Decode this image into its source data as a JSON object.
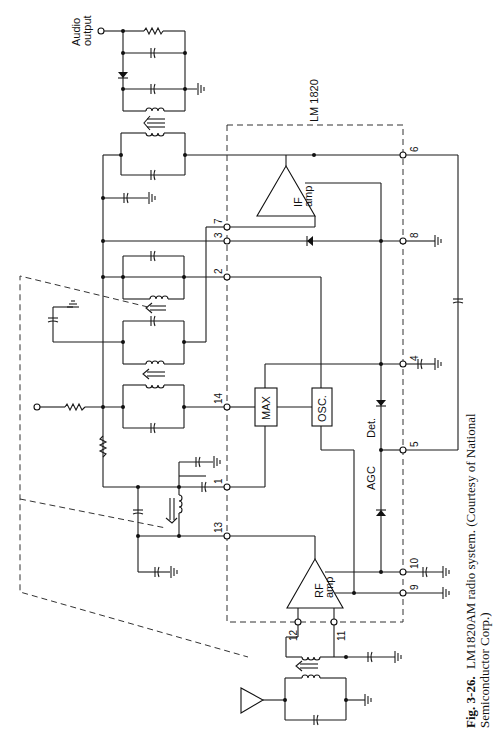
{
  "figure": {
    "chip_label": "LM 1820",
    "audio_output_label": [
      "Audio",
      "output"
    ],
    "blocks": {
      "if_amp": [
        "IF",
        "amp"
      ],
      "rf_amp": [
        "RF",
        "amp"
      ],
      "mixer": "MAX",
      "oscillator": "OSC.",
      "detector": "Det.",
      "agc": "AGC"
    },
    "pins": {
      "p1": "1",
      "p2": "2",
      "p3": "3",
      "p4": "4",
      "p5": "5",
      "p6": "6",
      "p7": "7",
      "p8": "8",
      "p9": "9",
      "p10": "10",
      "p11": "11",
      "p12": "12",
      "p13": "13",
      "p14": "14"
    },
    "caption": {
      "number": "Fig. 3-26.",
      "line1": "LM1820AM radio system. (Courtesy of National",
      "line2": "Semiconductor Corp.)"
    }
  }
}
